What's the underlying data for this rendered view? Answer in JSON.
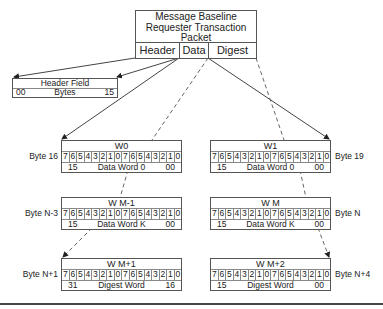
{
  "packet": {
    "title_lines": [
      "Message Baseline",
      "Requester Transaction",
      "Packet"
    ],
    "fields": [
      "Header",
      "Data",
      "Digest"
    ]
  },
  "header_field": {
    "title": "Header Field",
    "left": "00",
    "center": "Bytes",
    "right": "15"
  },
  "bit_labels": [
    "7",
    "6",
    "5",
    "4",
    "3",
    "2",
    "1",
    "0",
    "7",
    "6",
    "5",
    "4",
    "3",
    "2",
    "1",
    "0"
  ],
  "words": [
    {
      "id": "w0",
      "title": "W0",
      "byte_label": "Byte 16",
      "left": "15",
      "center": "Data Word 0",
      "right": "00"
    },
    {
      "id": "w1",
      "title": "W1",
      "byte_label": "Byte 19",
      "left": "15",
      "center": "Data Word 0",
      "right": "00"
    },
    {
      "id": "wm-1",
      "title": "W M-1",
      "byte_label": "Byte N-3",
      "left": "15",
      "center": "Data Word K",
      "right": "00"
    },
    {
      "id": "wm",
      "title": "W M",
      "byte_label": "Byte N",
      "left": "15",
      "center": "Data Word K",
      "right": "00"
    },
    {
      "id": "wm+1",
      "title": "W M+1",
      "byte_label": "Byte N+1",
      "left": "31",
      "center": "Digest Word",
      "right": "16"
    },
    {
      "id": "wm+2",
      "title": "W M+2",
      "byte_label": "Byte N+4",
      "left": "15",
      "center": "Digest Word",
      "right": "00"
    }
  ],
  "colors": {
    "line": "#444444",
    "border": "#555555",
    "background": "#ffffff"
  }
}
